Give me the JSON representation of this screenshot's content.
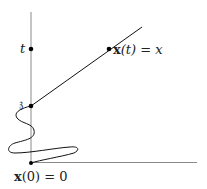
{
  "diagram": {
    "title": "",
    "axes": {
      "vertical_axis_color": "#8a8a8a",
      "horizontal_axis_color": "#8a8a8a"
    },
    "points": [
      {
        "id": "t",
        "label": "t"
      },
      {
        "id": "z",
        "label": "𝔷"
      },
      {
        "id": "xt",
        "label_bold": "x",
        "label_rest": "(t) = x"
      },
      {
        "id": "origin",
        "label_bold": "x",
        "label_rest": "(0) = 0"
      }
    ],
    "colors": {
      "curve": "#111111",
      "dot": "#000000",
      "text": "#222222"
    }
  }
}
